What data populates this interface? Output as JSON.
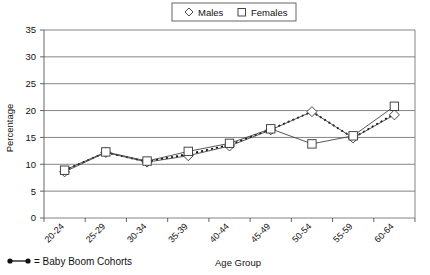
{
  "chart_data": {
    "type": "line",
    "title": "",
    "xlabel": "Age Group",
    "ylabel": "Percentage",
    "categories": [
      "20-24",
      "25-29",
      "30-34",
      "35-39",
      "40-44",
      "45-49",
      "50-54",
      "55-59",
      "60-64"
    ],
    "ylim": [
      0,
      35
    ],
    "ytick_step": 5,
    "yticks": [
      "0",
      "5",
      "10",
      "15",
      "20",
      "25",
      "30",
      "35"
    ],
    "grid": "horizontal",
    "legend_position": "top-center",
    "series": [
      {
        "name": "Males",
        "marker": "diamond",
        "values": [
          8.6,
          12.2,
          10.4,
          11.6,
          13.4,
          16.4,
          19.8,
          14.9,
          19.2
        ]
      },
      {
        "name": "Females",
        "marker": "square",
        "values": [
          8.9,
          12.3,
          10.6,
          12.4,
          13.9,
          16.6,
          13.8,
          15.3,
          20.8
        ]
      }
    ],
    "annotation_series": {
      "name": "Baby Boom Cohorts",
      "style": "dotted",
      "marker": "small-dot",
      "values": [
        8.9,
        12.2,
        10.5,
        11.9,
        13.6,
        16.5,
        19.8,
        14.9,
        19.4
      ]
    }
  },
  "legend": {
    "males_label": "Males",
    "females_label": "Females",
    "males_marker": "diamond-outline-icon",
    "females_marker": "square-outline-icon"
  },
  "footnote": {
    "marker": "baby-boom-dotted-line-icon",
    "text": "= Baby Boom Cohorts"
  }
}
